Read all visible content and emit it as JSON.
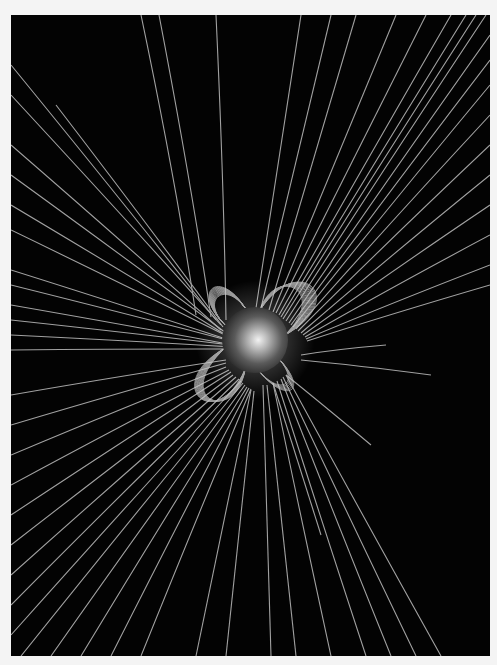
{
  "image": {
    "subject": "Sun with coronal magnetic field lines",
    "background": "#030303",
    "page_background": "#f4f4f4",
    "line_color": "#bdbdbd",
    "sun": {
      "cx": 244,
      "cy": 325,
      "r": 33
    },
    "open_lines_upper_left": [
      [
        [
          130,
          0
        ],
        [
          185,
          300
        ]
      ],
      [
        [
          205,
          0
        ],
        [
          215,
          305
        ]
      ],
      [
        [
          148,
          0
        ],
        [
          200,
          302
        ]
      ],
      [
        [
          0,
          50
        ],
        [
          205,
          305
        ]
      ],
      [
        [
          0,
          80
        ],
        [
          210,
          310
        ]
      ],
      [
        [
          0,
          130
        ],
        [
          210,
          315
        ]
      ],
      [
        [
          45,
          90
        ],
        [
          212,
          312
        ]
      ],
      [
        [
          0,
          160
        ],
        [
          215,
          318
        ]
      ],
      [
        [
          0,
          190
        ],
        [
          215,
          320
        ]
      ],
      [
        [
          0,
          215
        ],
        [
          218,
          322
        ]
      ],
      [
        [
          0,
          255
        ],
        [
          218,
          325
        ]
      ],
      [
        [
          0,
          270
        ],
        [
          220,
          326
        ]
      ],
      [
        [
          0,
          290
        ],
        [
          222,
          330
        ]
      ],
      [
        [
          0,
          320
        ],
        [
          222,
          332
        ]
      ],
      [
        [
          0,
          305
        ],
        [
          220,
          330
        ]
      ],
      [
        [
          0,
          335
        ],
        [
          220,
          334
        ]
      ]
    ],
    "open_lines_upper_right": [
      [
        [
          290,
          0
        ],
        [
          245,
          293
        ]
      ],
      [
        [
          320,
          0
        ],
        [
          250,
          293
        ]
      ],
      [
        [
          345,
          0
        ],
        [
          258,
          295
        ]
      ],
      [
        [
          385,
          0
        ],
        [
          262,
          297
        ]
      ],
      [
        [
          415,
          0
        ],
        [
          265,
          298
        ]
      ],
      [
        [
          440,
          0
        ],
        [
          268,
          300
        ]
      ],
      [
        [
          455,
          0
        ],
        [
          270,
          302
        ]
      ],
      [
        [
          465,
          0
        ],
        [
          272,
          304
        ]
      ],
      [
        [
          475,
          0
        ],
        [
          275,
          306
        ]
      ],
      [
        [
          479,
          20
        ],
        [
          278,
          308
        ]
      ],
      [
        [
          479,
          45
        ],
        [
          280,
          310
        ]
      ],
      [
        [
          479,
          70
        ],
        [
          282,
          312
        ]
      ],
      [
        [
          479,
          100
        ],
        [
          285,
          314
        ]
      ],
      [
        [
          479,
          130
        ],
        [
          287,
          316
        ]
      ],
      [
        [
          479,
          160
        ],
        [
          290,
          318
        ]
      ],
      [
        [
          479,
          190
        ],
        [
          292,
          320
        ]
      ],
      [
        [
          479,
          220
        ],
        [
          294,
          322
        ]
      ],
      [
        [
          479,
          250
        ],
        [
          295,
          324
        ]
      ],
      [
        [
          479,
          270
        ],
        [
          296,
          326
        ]
      ]
    ],
    "open_lines_lower_left": [
      [
        [
          0,
          380
        ],
        [
          215,
          345
        ]
      ],
      [
        [
          0,
          410
        ],
        [
          215,
          348
        ]
      ],
      [
        [
          0,
          440
        ],
        [
          215,
          352
        ]
      ],
      [
        [
          0,
          470
        ],
        [
          218,
          355
        ]
      ],
      [
        [
          0,
          500
        ],
        [
          220,
          357
        ]
      ],
      [
        [
          0,
          530
        ],
        [
          222,
          360
        ]
      ],
      [
        [
          0,
          560
        ],
        [
          225,
          362
        ]
      ],
      [
        [
          0,
          590
        ],
        [
          228,
          364
        ]
      ],
      [
        [
          0,
          620
        ],
        [
          230,
          366
        ]
      ],
      [
        [
          10,
          641
        ],
        [
          232,
          368
        ]
      ],
      [
        [
          40,
          641
        ],
        [
          234,
          370
        ]
      ],
      [
        [
          70,
          641
        ],
        [
          236,
          372
        ]
      ],
      [
        [
          100,
          641
        ],
        [
          238,
          373
        ]
      ],
      [
        [
          130,
          641
        ],
        [
          240,
          374
        ]
      ],
      [
        [
          185,
          641
        ],
        [
          240,
          375
        ]
      ],
      [
        [
          215,
          641
        ],
        [
          243,
          376
        ]
      ]
    ],
    "open_lines_lower_right": [
      [
        [
          260,
          641
        ],
        [
          252,
          370
        ]
      ],
      [
        [
          285,
          641
        ],
        [
          256,
          370
        ]
      ],
      [
        [
          320,
          641
        ],
        [
          262,
          368
        ]
      ],
      [
        [
          355,
          641
        ],
        [
          266,
          366
        ]
      ],
      [
        [
          380,
          641
        ],
        [
          270,
          364
        ]
      ],
      [
        [
          405,
          641
        ],
        [
          272,
          362
        ]
      ],
      [
        [
          430,
          641
        ],
        [
          275,
          360
        ]
      ],
      [
        [
          310,
          520
        ],
        [
          262,
          368
        ]
      ],
      [
        [
          360,
          430
        ],
        [
          275,
          360
        ]
      ],
      [
        [
          420,
          360
        ],
        [
          290,
          345
        ]
      ],
      [
        [
          375,
          330
        ],
        [
          290,
          340
        ]
      ]
    ]
  }
}
